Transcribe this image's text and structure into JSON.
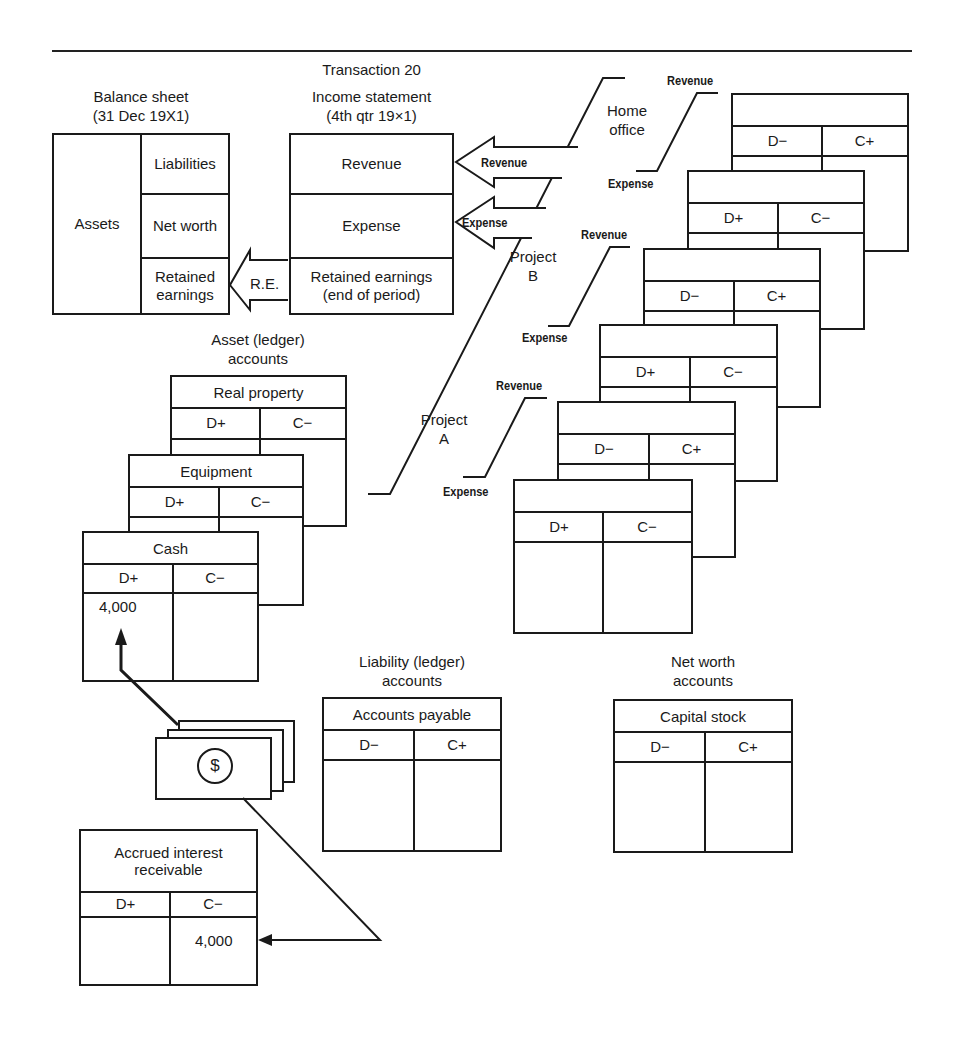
{
  "title": "Transaction 20",
  "balance_sheet": {
    "caption_line1": "Balance sheet",
    "caption_line2": "(31 Dec 19X1)",
    "assets": "Assets",
    "liabilities": "Liabilities",
    "net_worth": "Net worth",
    "retained_earnings_line1": "Retained",
    "retained_earnings_line2": "earnings"
  },
  "income_statement": {
    "caption_line1": "Income statement",
    "caption_line2": "(4th qtr 19×1)",
    "revenue": "Revenue",
    "expense": "Expense",
    "retained_line1": "Retained earnings",
    "retained_line2": "(end of period)"
  },
  "arrows": {
    "re_label": "R.E.",
    "revenue_label": "Revenue",
    "expense_label": "Expense"
  },
  "segments": {
    "home_office": {
      "line1": "Home",
      "line2": "office",
      "revenue": "Revenue",
      "expense": "Expense"
    },
    "project_b": {
      "line1": "Project",
      "line2": "B",
      "revenue": "Revenue",
      "expense": "Expense"
    },
    "project_a": {
      "line1": "Project",
      "line2": "A",
      "revenue": "Revenue",
      "expense": "Expense"
    }
  },
  "segment_accounts": [
    {
      "title": "",
      "debit": "D−",
      "credit": "C+"
    },
    {
      "title": "",
      "debit": "D+",
      "credit": "C−"
    },
    {
      "title": "",
      "debit": "D−",
      "credit": "C+"
    },
    {
      "title": "",
      "debit": "D+",
      "credit": "C−"
    },
    {
      "title": "",
      "debit": "D−",
      "credit": "C+"
    },
    {
      "title": "",
      "debit": "D+",
      "credit": "C−"
    }
  ],
  "asset_accounts": {
    "caption_line1": "Asset (ledger)",
    "caption_line2": "accounts",
    "real_property": {
      "title": "Real property",
      "debit": "D+",
      "credit": "C−"
    },
    "equipment": {
      "title": "Equipment",
      "debit": "D+",
      "credit": "C−"
    },
    "cash": {
      "title": "Cash",
      "debit": "D+",
      "credit": "C−",
      "debit_amount": "4,000"
    }
  },
  "liability_accounts": {
    "caption_line1": "Liability (ledger)",
    "caption_line2": "accounts",
    "accounts_payable": {
      "title": "Accounts payable",
      "debit": "D−",
      "credit": "C+"
    }
  },
  "net_worth_accounts": {
    "caption_line1": "Net worth",
    "caption_line2": "accounts",
    "capital_stock": {
      "title": "Capital stock",
      "debit": "D−",
      "credit": "C+"
    }
  },
  "accrued_interest": {
    "title_line1": "Accrued interest",
    "title_line2": "receivable",
    "debit": "D+",
    "credit": "C−",
    "credit_amount": "4,000"
  },
  "money": {
    "symbol": "$",
    "icon": "dollar-bills-icon"
  }
}
